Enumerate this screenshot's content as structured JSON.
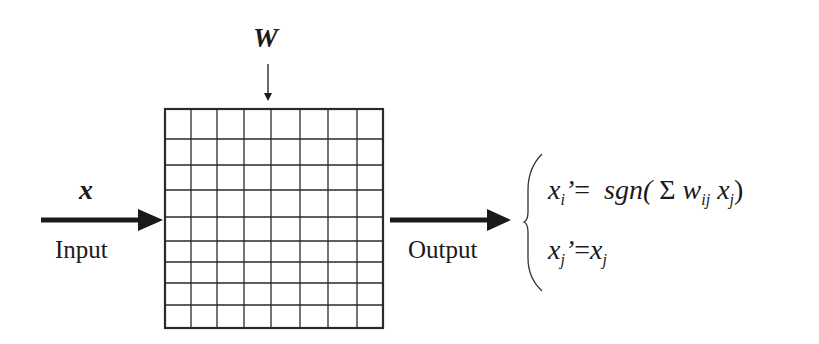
{
  "diagram": {
    "matrix": {
      "label": "W",
      "rows": 9,
      "cols": 8
    },
    "input": {
      "symbol": "x",
      "label": "Input"
    },
    "output": {
      "label": "Output"
    },
    "equations": [
      {
        "lhs_var": "x",
        "lhs_sub": "i",
        "prime": "’",
        "eq": "=",
        "rhs_fn": "sgn(",
        "sigma": "Σ",
        "w": "w",
        "w_sub": "ij",
        "x": "x",
        "x_sub": "j",
        "close": ")"
      },
      {
        "lhs_var": "x",
        "lhs_sub": "j",
        "prime": "’",
        "eq": "=",
        "rhs_var": "x",
        "rhs_sub": "j"
      }
    ]
  }
}
